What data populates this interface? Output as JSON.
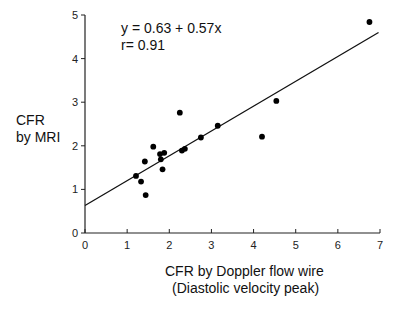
{
  "chart_data": {
    "type": "scatter",
    "title": "",
    "xlabel": "CFR by Doppler flow wire (Diastolic velocity peak)",
    "xlabel_lines": [
      "CFR by Doppler flow wire",
      "(Diastolic velocity peak)"
    ],
    "ylabel": "CFR by MRI",
    "ylabel_lines": [
      "CFR",
      "by MRI"
    ],
    "xlim": [
      0,
      7
    ],
    "ylim": [
      0,
      5
    ],
    "x_ticks": [
      "0",
      "1",
      "2",
      "3",
      "4",
      "5",
      "6",
      "7"
    ],
    "y_ticks": [
      "0",
      "1",
      "2",
      "3",
      "4",
      "5"
    ],
    "grid": false,
    "legend": null,
    "annotations": [
      "y = 0.63 + 0.57x",
      "r= 0.91"
    ],
    "regression": {
      "intercept": 0.63,
      "slope": 0.57,
      "r": 0.91,
      "x_range": [
        0,
        7
      ]
    },
    "series": [
      {
        "name": "patients",
        "x": [
          1.21,
          1.33,
          1.44,
          1.42,
          1.62,
          1.78,
          1.8,
          1.88,
          1.84,
          2.25,
          2.3,
          2.37,
          2.75,
          3.15,
          4.2,
          4.54,
          6.75
        ],
        "y": [
          1.31,
          1.18,
          0.87,
          1.64,
          1.98,
          1.81,
          1.69,
          1.84,
          1.46,
          2.76,
          1.89,
          1.93,
          2.19,
          2.46,
          2.21,
          3.03,
          4.84
        ]
      }
    ]
  },
  "labels": {
    "equation": "y = 0.63 + 0.57x",
    "r_value": "r= 0.91",
    "ylabel_line1": "CFR",
    "ylabel_line2": "by MRI",
    "xlabel_line1": "CFR by Doppler flow wire",
    "xlabel_line2": "(Diastolic velocity peak)"
  },
  "colors": {
    "axis": "#222222",
    "points": "#000000",
    "line": "#111111",
    "background": "#ffffff"
  }
}
